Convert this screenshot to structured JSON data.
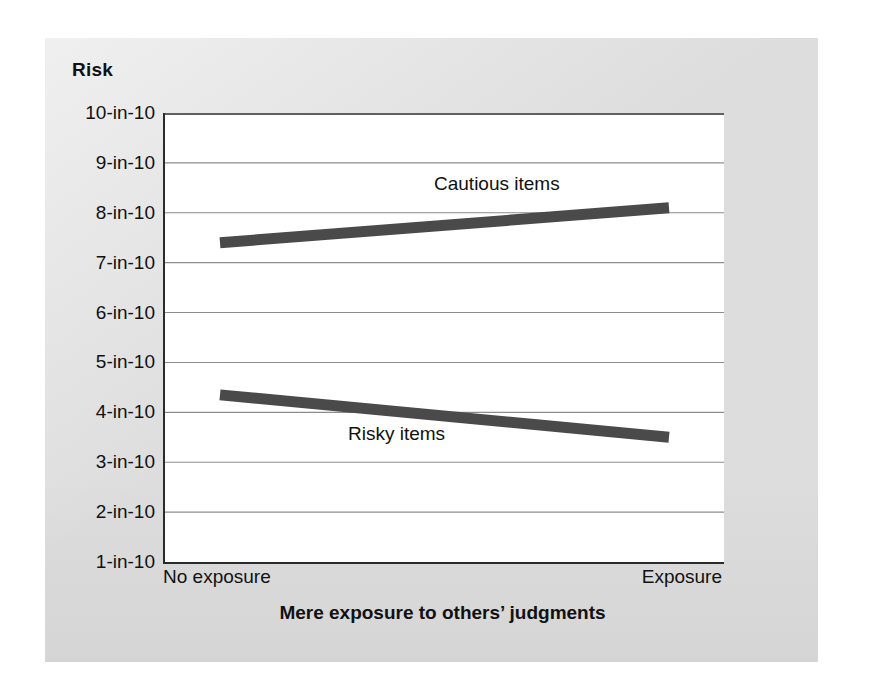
{
  "figure": {
    "panel_color": "#dddddd",
    "plot_background": "#ffffff",
    "axis_color": "#2b2b2b",
    "gridline_color": "#8d8d8d",
    "series_color": "#4a4a4a"
  },
  "chart_data": {
    "type": "line",
    "title": "",
    "ylabel": "Risk",
    "xlabel": "Mere exposure to others’ judgments",
    "x": [
      "No exposure",
      "Exposure"
    ],
    "categories": [
      "No exposure",
      "Exposure"
    ],
    "xticklabels": [
      "No exposure",
      "Exposure"
    ],
    "yticklabels": [
      "10-in-10",
      "9-in-10",
      "8-in-10",
      "7-in-10",
      "6-in-10",
      "5-in-10",
      "4-in-10",
      "3-in-10",
      "2-in-10",
      "1-in-10"
    ],
    "ytickvalues": [
      10,
      9,
      8,
      7,
      6,
      5,
      4,
      3,
      2,
      1
    ],
    "ylim": [
      1,
      10
    ],
    "grid": true,
    "grid_axis": "y",
    "legend": "inline-annotations",
    "series": [
      {
        "name": "Cautious items",
        "label": "Cautious items",
        "values": [
          7.4,
          8.1
        ],
        "color": "#4a4a4a",
        "linewidth": 11
      },
      {
        "name": "Risky items",
        "label": "Risky items",
        "values": [
          4.35,
          3.5
        ],
        "color": "#4a4a4a",
        "linewidth": 11
      }
    ],
    "annotations": [
      {
        "text": "Cautious items",
        "x": 0.48,
        "y": 8.7
      },
      {
        "text": "Risky items",
        "x": 0.33,
        "y": 3.95
      }
    ]
  }
}
